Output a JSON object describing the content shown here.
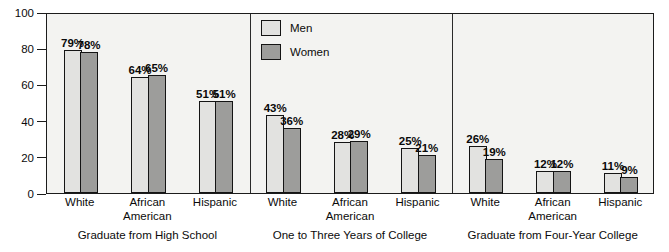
{
  "chart_data": {
    "type": "bar",
    "title": "",
    "subtitle": "",
    "xlabel": "",
    "ylabel": "",
    "ylim": [
      0,
      100
    ],
    "yticks": [
      0,
      20,
      40,
      60,
      80,
      100
    ],
    "ytick_labels": [
      "0",
      "20",
      "40",
      "60",
      "80",
      "100"
    ],
    "grid": false,
    "legend_position": "top-center",
    "categories": [
      "White",
      "African American",
      "Hispanic"
    ],
    "series": [
      {
        "name": "Men",
        "color": "#e2e2e0"
      },
      {
        "name": "Women",
        "color": "#9d9d9b"
      }
    ],
    "panels": [
      {
        "caption": "Graduate from High School",
        "groups": [
          {
            "category": "White",
            "category_lines": [
              "White"
            ],
            "men": 79,
            "women": 78,
            "men_label": "79%",
            "women_label": "78%"
          },
          {
            "category": "African American",
            "category_lines": [
              "African",
              "American"
            ],
            "men": 64,
            "women": 65,
            "men_label": "64%",
            "women_label": "65%"
          },
          {
            "category": "Hispanic",
            "category_lines": [
              "Hispanic"
            ],
            "men": 51,
            "women": 51,
            "men_label": "51%",
            "women_label": "51%"
          }
        ]
      },
      {
        "caption": "One to Three Years of College",
        "groups": [
          {
            "category": "White",
            "category_lines": [
              "White"
            ],
            "men": 43,
            "women": 36,
            "men_label": "43%",
            "women_label": "36%"
          },
          {
            "category": "African American",
            "category_lines": [
              "African",
              "American"
            ],
            "men": 28,
            "women": 29,
            "men_label": "28%",
            "women_label": "29%"
          },
          {
            "category": "Hispanic",
            "category_lines": [
              "Hispanic"
            ],
            "men": 25,
            "women": 21,
            "men_label": "25%",
            "women_label": "21%"
          }
        ]
      },
      {
        "caption": "Graduate from Four-Year College",
        "groups": [
          {
            "category": "White",
            "category_lines": [
              "White"
            ],
            "men": 26,
            "women": 19,
            "men_label": "26%",
            "women_label": "19%"
          },
          {
            "category": "African American",
            "category_lines": [
              "African",
              "American"
            ],
            "men": 12,
            "women": 12,
            "men_label": "12%",
            "women_label": "12%"
          },
          {
            "category": "Hispanic",
            "category_lines": [
              "Hispanic"
            ],
            "men": 11,
            "women": 9,
            "men_label": "11%",
            "women_label": "9%"
          }
        ]
      }
    ]
  },
  "legend": {
    "items": [
      {
        "label": "Men",
        "swatch": "men"
      },
      {
        "label": "Women",
        "swatch": "women"
      }
    ]
  },
  "colors": {
    "men_fill": "#e2e2e0",
    "women_fill": "#9d9d9b",
    "plot_background": "#f3f3f1",
    "axis_line": "#1c1c1c",
    "text": "#0b0b0b"
  }
}
